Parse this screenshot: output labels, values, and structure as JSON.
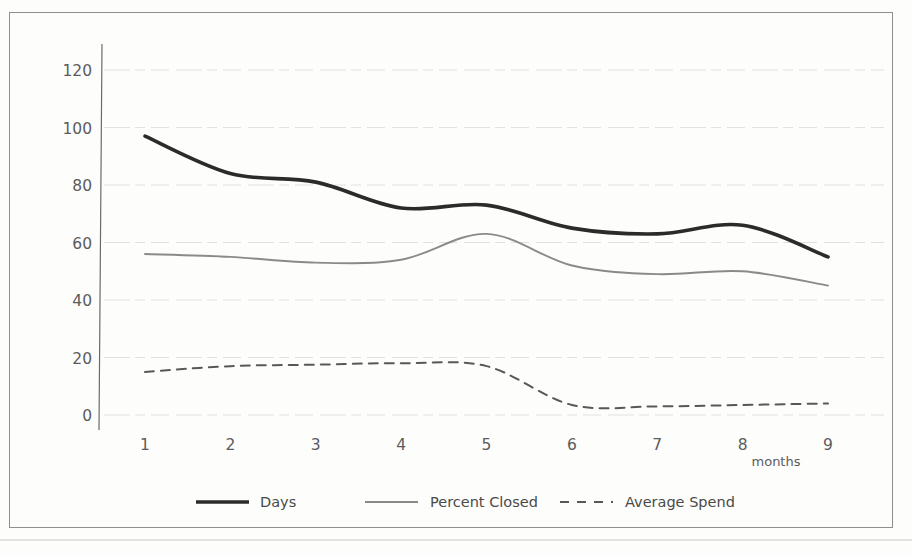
{
  "chart_data": {
    "type": "line",
    "title": "",
    "xlabel": "months",
    "ylabel": "",
    "x": [
      1,
      2,
      3,
      4,
      5,
      6,
      7,
      8,
      9
    ],
    "categories": [
      "1",
      "2",
      "3",
      "4",
      "5",
      "6",
      "7",
      "8",
      "9"
    ],
    "xlim": [
      1,
      9
    ],
    "ylim": [
      0,
      120
    ],
    "yticks": [
      0,
      20,
      40,
      60,
      80,
      100,
      120
    ],
    "ytick_labels": [
      "0",
      "20",
      "40",
      "60",
      "80",
      "100",
      "120"
    ],
    "xtick_labels": [
      "1",
      "2",
      "3",
      "4",
      "5",
      "6",
      "7",
      "8",
      "9"
    ],
    "grid": true,
    "grid_axis": "y",
    "legend_position": "bottom",
    "smoothing": "spline",
    "series": [
      {
        "name": "Days",
        "values": [
          97,
          84,
          81,
          72,
          73,
          65,
          63,
          66,
          55
        ],
        "color": "#2b2b2b",
        "style": "solid",
        "width": 3.6
      },
      {
        "name": "Percent Closed",
        "values": [
          56,
          55,
          53,
          54,
          63,
          52,
          49,
          50,
          45
        ],
        "color": "#8a8a8a",
        "style": "solid",
        "width": 1.9
      },
      {
        "name": "Average Spend",
        "values": [
          15,
          17,
          17.5,
          18,
          17,
          3.5,
          3,
          3.5,
          4
        ],
        "color": "#585858",
        "style": "dashed",
        "width": 2.0
      }
    ]
  },
  "legend": {
    "items": [
      {
        "label": "Days"
      },
      {
        "label": "Percent Closed"
      },
      {
        "label": "Average Spend"
      }
    ]
  },
  "axes": {
    "x_axis_title": "months"
  },
  "colors": {
    "days": "#2b2b2b",
    "percent_closed": "#8a8a8a",
    "average_spend": "#585858",
    "grid": "#dedede",
    "axis": "#6b6b6b",
    "tick_text": "#5c5c5c",
    "frame": "#8f8f8f",
    "background": "#ffffff"
  }
}
